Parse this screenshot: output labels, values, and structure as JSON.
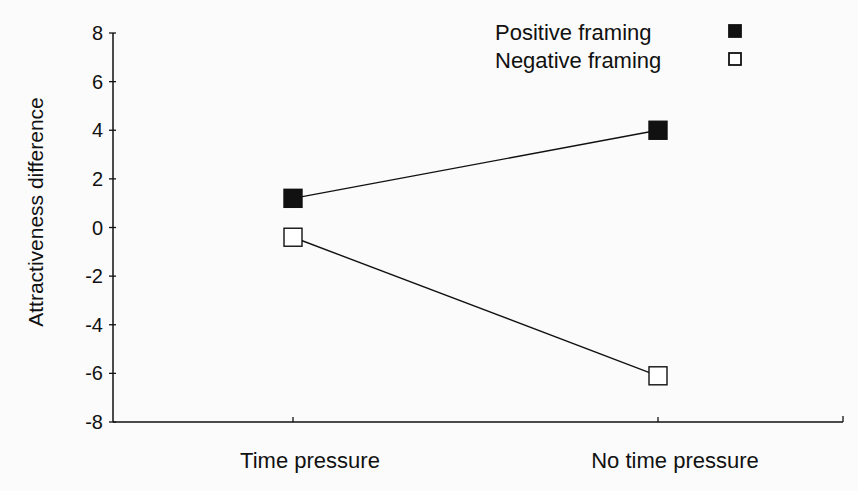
{
  "chart_data": {
    "type": "line",
    "title": "",
    "xlabel": "",
    "ylabel": "Attractiveness difference",
    "categories": [
      "Time pressure",
      "No time pressure"
    ],
    "series": [
      {
        "name": "Positive framing",
        "marker": "filled-square",
        "values": [
          1.2,
          4.0
        ]
      },
      {
        "name": "Negative framing",
        "marker": "open-square",
        "values": [
          -0.4,
          -6.1
        ]
      }
    ],
    "ylim": [
      -8,
      8
    ],
    "yticks": [
      8,
      6,
      4,
      2,
      0,
      -2,
      -4,
      -6,
      -8
    ],
    "ytick_labels": [
      "8",
      "6",
      "4",
      "2",
      "0",
      "-2",
      "-4",
      "-6",
      "-8"
    ],
    "grid": false,
    "legend_position": "top-right"
  },
  "colors": {
    "ink": "#111111",
    "background": "#fbfbfb",
    "open_fill": "#ffffff"
  }
}
